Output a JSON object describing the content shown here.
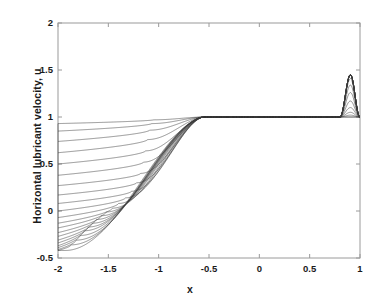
{
  "chart_data": {
    "type": "line",
    "title": "",
    "xlabel": "x",
    "ylabel": "Horizontal lubricant velocity, u",
    "xlim": [
      -2,
      1
    ],
    "ylim": [
      -0.5,
      2
    ],
    "xticks": [
      -2,
      -1.5,
      -1,
      -0.5,
      0,
      0.5,
      1
    ],
    "xticklabels": [
      "-2",
      "-1.5",
      "-1",
      "-0.5",
      "0",
      "0.5",
      "1"
    ],
    "yticks": [
      -0.5,
      0,
      0.5,
      1,
      1.5,
      2
    ],
    "yticklabels": [
      "-0.5",
      "0",
      "0.5",
      "1",
      "1.5",
      "2"
    ],
    "grid": false,
    "legend": null,
    "line_color": "#3a3a3a",
    "axis_color": "#9a9a9a",
    "series": [
      {
        "name": "profile-1",
        "dip_min": 0.97,
        "dip_x": -1.05,
        "left_end": 0.93,
        "peak": 1.0
      },
      {
        "name": "profile-2",
        "dip_min": 0.93,
        "dip_x": -1.07,
        "left_end": 0.85,
        "peak": 1.0
      },
      {
        "name": "profile-3",
        "dip_min": 0.86,
        "dip_x": -1.09,
        "left_end": 0.74,
        "peak": 1.02
      },
      {
        "name": "profile-4",
        "dip_min": 0.76,
        "dip_x": -1.11,
        "left_end": 0.62,
        "peak": 1.05
      },
      {
        "name": "profile-5",
        "dip_min": 0.64,
        "dip_x": -1.13,
        "left_end": 0.5,
        "peak": 1.1
      },
      {
        "name": "profile-6",
        "dip_min": 0.52,
        "dip_x": -1.15,
        "left_end": 0.38,
        "peak": 1.17
      },
      {
        "name": "profile-7",
        "dip_min": 0.4,
        "dip_x": -1.18,
        "left_end": 0.27,
        "peak": 1.26
      },
      {
        "name": "profile-8",
        "dip_min": 0.3,
        "dip_x": -1.22,
        "left_end": 0.17,
        "peak": 1.34
      },
      {
        "name": "profile-9",
        "dip_min": 0.21,
        "dip_x": -1.27,
        "left_end": 0.08,
        "peak": 1.41
      },
      {
        "name": "profile-10",
        "dip_min": 0.14,
        "dip_x": -1.33,
        "left_end": 0.0,
        "peak": 1.45
      },
      {
        "name": "profile-11",
        "dip_min": 0.08,
        "dip_x": -1.4,
        "left_end": -0.07,
        "peak": 1.45
      },
      {
        "name": "profile-12",
        "dip_min": 0.03,
        "dip_x": -1.46,
        "left_end": -0.13,
        "peak": 1.45
      },
      {
        "name": "profile-13",
        "dip_min": -0.01,
        "dip_x": -1.52,
        "left_end": -0.18,
        "peak": 1.45
      },
      {
        "name": "profile-14",
        "dip_min": -0.05,
        "dip_x": -1.57,
        "left_end": -0.23,
        "peak": 1.45
      },
      {
        "name": "profile-15",
        "dip_min": -0.09,
        "dip_x": -1.62,
        "left_end": -0.27,
        "peak": 1.45
      },
      {
        "name": "profile-16",
        "dip_min": -0.13,
        "dip_x": -1.66,
        "left_end": -0.31,
        "peak": 1.45
      },
      {
        "name": "profile-17",
        "dip_min": -0.17,
        "dip_x": -1.7,
        "left_end": -0.34,
        "peak": 1.45
      },
      {
        "name": "profile-18",
        "dip_min": -0.21,
        "dip_x": -1.74,
        "left_end": -0.37,
        "peak": 1.45
      },
      {
        "name": "profile-19",
        "dip_min": -0.26,
        "dip_x": -1.78,
        "left_end": -0.39,
        "peak": 1.45
      },
      {
        "name": "profile-20",
        "dip_min": -0.31,
        "dip_x": -1.82,
        "left_end": -0.41,
        "peak": 1.45
      },
      {
        "name": "profile-21",
        "dip_min": -0.36,
        "dip_x": -1.87,
        "left_end": -0.42,
        "peak": 1.45
      },
      {
        "name": "profile-22",
        "dip_min": -0.42,
        "dip_x": -1.93,
        "left_end": -0.42,
        "peak": 1.45
      }
    ],
    "spike": {
      "x_start": 0.8,
      "x_end": 1.0,
      "x_peak": 0.905,
      "peak_heights": [
        1.0,
        1.05,
        1.17,
        1.28,
        1.38,
        1.45
      ]
    }
  }
}
